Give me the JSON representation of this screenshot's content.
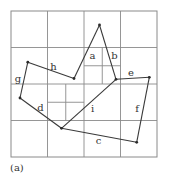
{
  "figure": {
    "caption": "(a)",
    "type": "quadtree with polygon edges",
    "outer_box": {
      "x1": 11,
      "y1": 11,
      "x2": 157,
      "y2": 157
    },
    "grid": {
      "vertical": [
        47.5,
        84,
        120.5
      ],
      "horizontal": [
        47.5,
        84,
        120.5
      ],
      "subdivided_cells": [
        {
          "x1": 84,
          "y1": 47.5,
          "x2": 120.5,
          "y2": 84,
          "mid_x": 102.25,
          "mid_y": 65.75
        },
        {
          "x1": 47.5,
          "y1": 84,
          "x2": 84,
          "y2": 120.5,
          "mid_x": 65.75,
          "mid_y": 102.25
        }
      ]
    },
    "vertices": {
      "p1": [
        99.5,
        25
      ],
      "p2": [
        116,
        79.3
      ],
      "p3": [
        149.3,
        77.3
      ],
      "p4": [
        136.7,
        142.3
      ],
      "p5": [
        61.5,
        128.3
      ],
      "p6": [
        20,
        98
      ],
      "p7": [
        27.8,
        62.2
      ],
      "p8": [
        74,
        78.5
      ]
    },
    "edges": [
      {
        "label": "a",
        "from": "p8",
        "to": "p1",
        "label_pos": [
          92.5,
          59
        ]
      },
      {
        "label": "b",
        "from": "p1",
        "to": "p2",
        "label_pos": [
          114.5,
          58.5
        ]
      },
      {
        "label": "e",
        "from": "p2",
        "to": "p3",
        "label_pos": [
          131,
          76
        ]
      },
      {
        "label": "f",
        "from": "p3",
        "to": "p4",
        "label_pos": [
          137,
          112
        ]
      },
      {
        "label": "c",
        "from": "p4",
        "to": "p5",
        "label_pos": [
          98.5,
          144
        ]
      },
      {
        "label": "i",
        "from": "p5",
        "to": "p2",
        "label_pos": [
          92.5,
          112
        ]
      },
      {
        "label": "d",
        "from": "p5",
        "to": "p6",
        "label_pos": [
          40.5,
          111
        ]
      },
      {
        "label": "g",
        "from": "p6",
        "to": "p7",
        "label_pos": [
          18,
          81.5
        ]
      },
      {
        "label": "h",
        "from": "p7",
        "to": "p8",
        "label_pos": [
          53.5,
          69.5
        ]
      }
    ],
    "colors": {
      "grid": "#8a8a8a",
      "edge": "#3a3a3a",
      "text": "#333333"
    }
  }
}
